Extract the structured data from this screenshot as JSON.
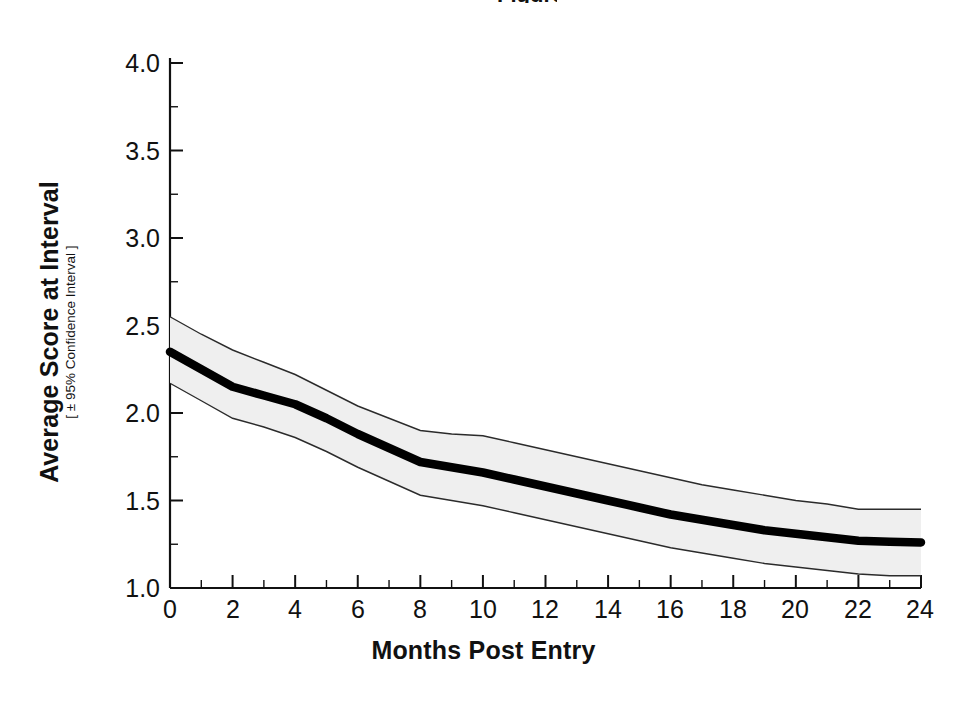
{
  "figure": {
    "title_fragment": "Figure",
    "background_color": "#ffffff",
    "ink_color": "#111111",
    "band_fill_color": "#efefef",
    "band_edge_color": "#2b2b2b",
    "line_color": "#000000"
  },
  "axes": {
    "x_title": "Months Post Entry",
    "y_title_main": "Average Score at Interval",
    "y_title_sub": "[ ± 95% Confidence Interval ]",
    "x_ticks": [
      "0",
      "2",
      "4",
      "6",
      "8",
      "10",
      "12",
      "14",
      "16",
      "18",
      "20",
      "22",
      "24"
    ],
    "y_ticks": [
      "1.0",
      "1.5",
      "2.0",
      "2.5",
      "3.0",
      "3.5",
      "4.0"
    ]
  },
  "chart_data": {
    "type": "line",
    "xlabel": "Months Post Entry",
    "ylabel": "Average Score at Interval [ ± 95% Confidence Interval ]",
    "xlim": [
      0,
      24
    ],
    "ylim": [
      1.0,
      4.0
    ],
    "xtick_values": [
      0,
      2,
      4,
      6,
      8,
      10,
      12,
      14,
      16,
      18,
      20,
      22,
      24
    ],
    "xtick_minor_step": 1,
    "ytick_values": [
      1.0,
      1.5,
      2.0,
      2.5,
      3.0,
      3.5,
      4.0
    ],
    "ytick_minor_step": 0.25,
    "grid": false,
    "legend": null,
    "x": [
      0,
      1,
      2,
      3,
      4,
      5,
      6,
      7,
      8,
      9,
      10,
      11,
      12,
      13,
      14,
      15,
      16,
      17,
      18,
      19,
      20,
      21,
      22,
      23,
      24
    ],
    "series": [
      {
        "name": "Average Score at Interval",
        "style": "thick-black-line",
        "values": [
          2.35,
          2.25,
          2.15,
          2.1,
          2.05,
          1.97,
          1.88,
          1.8,
          1.72,
          1.69,
          1.66,
          1.62,
          1.58,
          1.54,
          1.5,
          1.46,
          1.42,
          1.39,
          1.36,
          1.33,
          1.31,
          1.29,
          1.27,
          1.265,
          1.26
        ]
      },
      {
        "name": "Upper 95% Confidence Limit",
        "style": "thin-band-edge",
        "values": [
          2.55,
          2.45,
          2.36,
          2.29,
          2.22,
          2.13,
          2.04,
          1.97,
          1.9,
          1.88,
          1.87,
          1.83,
          1.79,
          1.75,
          1.71,
          1.67,
          1.63,
          1.59,
          1.56,
          1.53,
          1.5,
          1.48,
          1.45,
          1.45,
          1.45
        ]
      },
      {
        "name": "Lower 95% Confidence Limit",
        "style": "thin-band-edge",
        "values": [
          2.17,
          2.07,
          1.97,
          1.92,
          1.86,
          1.78,
          1.69,
          1.61,
          1.53,
          1.5,
          1.47,
          1.43,
          1.39,
          1.35,
          1.31,
          1.27,
          1.23,
          1.2,
          1.17,
          1.14,
          1.12,
          1.1,
          1.08,
          1.07,
          1.07
        ]
      }
    ]
  }
}
